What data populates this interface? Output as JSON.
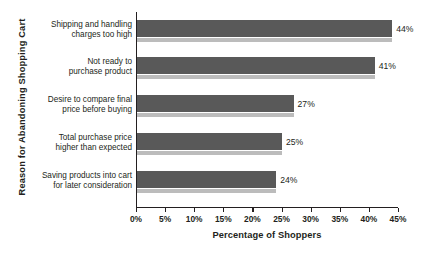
{
  "chart_data": {
    "type": "bar",
    "orientation": "horizontal",
    "title": "",
    "xlabel": "Percentage of Shoppers",
    "ylabel": "Reason for Abandoning Shopping Cart",
    "xlim": [
      0,
      45
    ],
    "grid": false,
    "legend": null,
    "xticks": [
      "0%",
      "5%",
      "10%",
      "15%",
      "20%",
      "25%",
      "30%",
      "35%",
      "40%",
      "45%"
    ],
    "xtick_values": [
      0,
      5,
      10,
      15,
      20,
      25,
      30,
      35,
      40,
      45
    ],
    "categories": [
      "Shipping and handling charges too high",
      "Not ready to purchase product",
      "Desire to compare final price before buying",
      "Total purchase price higher than expected",
      "Saving products into cart for later consideration"
    ],
    "category_lines": [
      [
        "Shipping and handling",
        "charges too high"
      ],
      [
        "Not ready to",
        "purchase product"
      ],
      [
        "Desire to compare final",
        "price before buying"
      ],
      [
        "Total purchase price",
        "higher than expected"
      ],
      [
        "Saving products into cart",
        "for later consideration"
      ]
    ],
    "values": [
      44,
      41,
      27,
      25,
      24
    ],
    "data_labels": [
      "44%",
      "41%",
      "27%",
      "25%",
      "24%"
    ],
    "colors": {
      "bar": "#595959",
      "bar_shadow": "#bcbcbc",
      "axis": "#231f20",
      "text": "#231f20",
      "background": "#ffffff"
    }
  }
}
